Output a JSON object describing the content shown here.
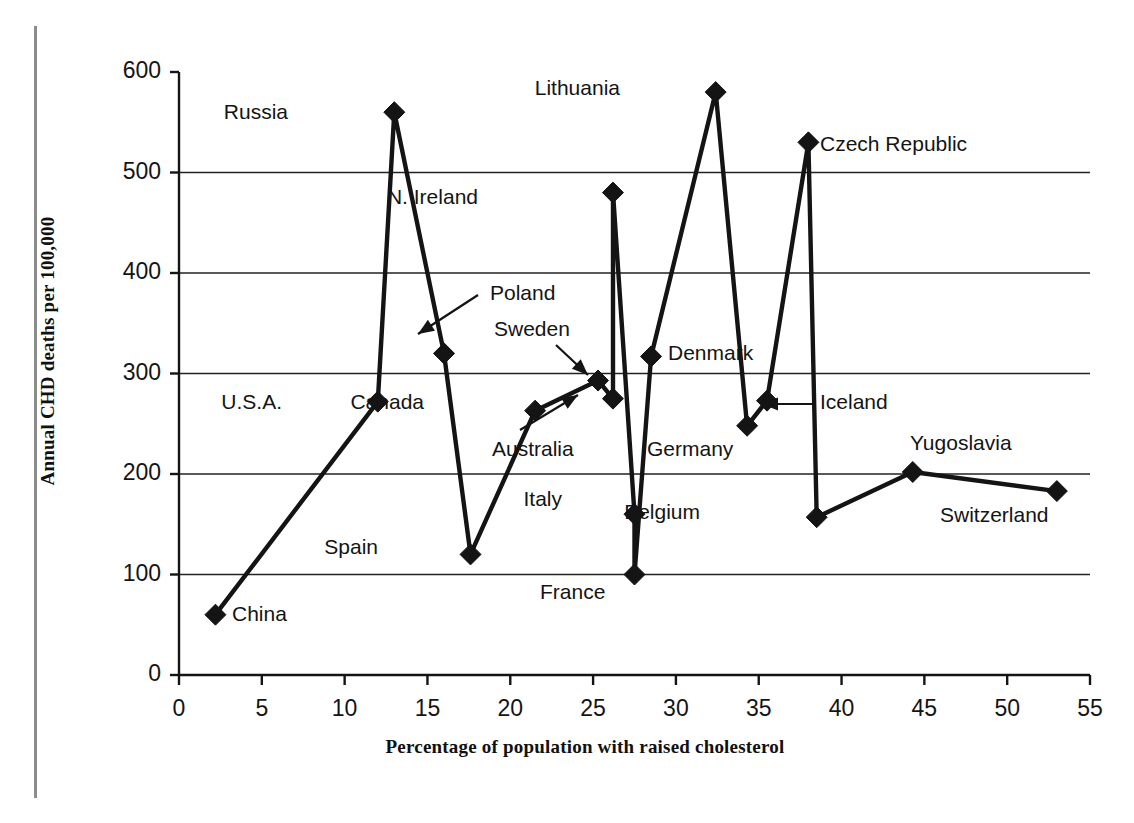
{
  "chart_data": {
    "type": "scatter",
    "title": "",
    "xlabel": "Percentage of population with raised cholesterol",
    "ylabel": "Annual CHD deaths per 100,000",
    "xlim": [
      0,
      55
    ],
    "ylim": [
      0,
      600
    ],
    "xticks": [
      "0",
      "5",
      "10",
      "15",
      "20",
      "25",
      "30",
      "35",
      "40",
      "45",
      "50",
      "55"
    ],
    "yticks": [
      "0",
      "100",
      "200",
      "300",
      "400",
      "500",
      "600"
    ],
    "grid": "horizontal",
    "legend": "none",
    "marker": "filled-diamond",
    "series_name": "Countries",
    "points": [
      {
        "label": "China",
        "x": 2.2,
        "y": 60,
        "lx": 232,
        "ly": 602,
        "anchor": "left"
      },
      {
        "label": "U.S.A.",
        "x": 12.0,
        "y": 272,
        "lx": 282,
        "ly": 390,
        "anchor": "right"
      },
      {
        "label": "Russia",
        "x": 13.0,
        "y": 560,
        "lx": 288,
        "ly": 100,
        "anchor": "right"
      },
      {
        "label": "Poland",
        "x": 16.0,
        "y": 320,
        "lx": 490,
        "ly": 281,
        "anchor": "left"
      },
      {
        "label": "Spain",
        "x": 17.6,
        "y": 120,
        "lx": 378,
        "ly": 535,
        "anchor": "right"
      },
      {
        "label": "Australia",
        "x": 21.5,
        "y": 263,
        "lx": 492,
        "ly": 437,
        "anchor": "left"
      },
      {
        "label": "Canada",
        "x": 21.5,
        "y": 263,
        "lx": 424,
        "ly": 390,
        "anchor": "right"
      },
      {
        "label": "Sweden",
        "x": 25.3,
        "y": 293,
        "lx": 494,
        "ly": 317,
        "anchor": "left"
      },
      {
        "label": "N. Ireland",
        "x": 26.2,
        "y": 480,
        "lx": 478,
        "ly": 185,
        "anchor": "right"
      },
      {
        "label": "Italy",
        "x": 27.5,
        "y": 160,
        "lx": 562,
        "ly": 487,
        "anchor": "right"
      },
      {
        "label": "France",
        "x": 27.5,
        "y": 100,
        "lx": 540,
        "ly": 580,
        "anchor": "left"
      },
      {
        "label": "Germany",
        "x": 28.5,
        "y": 317,
        "lx": 647,
        "ly": 437,
        "anchor": "left"
      },
      {
        "label": "Denmark",
        "x": 28.5,
        "y": 317,
        "lx": 668,
        "ly": 341,
        "anchor": "left"
      },
      {
        "label": "Lithuania",
        "x": 32.4,
        "y": 580,
        "lx": 620,
        "ly": 76,
        "anchor": "right"
      },
      {
        "label": "Iceland",
        "x": 35.5,
        "y": 273,
        "lx": 820,
        "ly": 390,
        "anchor": "left"
      },
      {
        "label": "Czech Republic",
        "x": 38.0,
        "y": 530,
        "lx": 820,
        "ly": 132,
        "anchor": "left"
      },
      {
        "label": "Belgium",
        "x": 38.5,
        "y": 157,
        "lx": 700,
        "ly": 500,
        "anchor": "right"
      },
      {
        "label": "Yugoslavia",
        "x": 44.3,
        "y": 202,
        "lx": 910,
        "ly": 431,
        "anchor": "left"
      },
      {
        "label": "Switzerland",
        "x": 53.0,
        "y": 183,
        "lx": 940,
        "ly": 503,
        "anchor": "left"
      }
    ],
    "connected_path": [
      {
        "x": 2.2,
        "y": 60
      },
      {
        "x": 12.0,
        "y": 272
      },
      {
        "x": 13.0,
        "y": 560
      },
      {
        "x": 16.0,
        "y": 320
      },
      {
        "x": 17.6,
        "y": 120
      },
      {
        "x": 21.5,
        "y": 263
      },
      {
        "x": 25.3,
        "y": 293
      },
      {
        "x": 26.2,
        "y": 275
      },
      {
        "x": 26.2,
        "y": 480
      },
      {
        "x": 27.5,
        "y": 160
      },
      {
        "x": 27.5,
        "y": 100
      },
      {
        "x": 28.5,
        "y": 317
      },
      {
        "x": 32.4,
        "y": 580
      },
      {
        "x": 34.3,
        "y": 248
      },
      {
        "x": 35.5,
        "y": 273
      },
      {
        "x": 38.0,
        "y": 530
      },
      {
        "x": 38.5,
        "y": 157
      },
      {
        "x": 44.3,
        "y": 202
      },
      {
        "x": 53.0,
        "y": 183
      }
    ],
    "callouts": [
      {
        "name": "poland-arrow",
        "from": [
          478,
          295
        ],
        "to": [
          418,
          334
        ]
      },
      {
        "name": "sweden-arrow",
        "from": [
          556,
          345
        ],
        "to": [
          588,
          375
        ]
      },
      {
        "name": "australia-arrow",
        "from": [
          520,
          430
        ],
        "to": [
          578,
          395
        ]
      },
      {
        "name": "iceland-arrow",
        "from": [
          812,
          404
        ],
        "to": [
          762,
          404
        ]
      }
    ],
    "colors": {
      "ink": "#141414",
      "grid": "#222222",
      "background": "#ffffff",
      "page_rule": "#8c8c8c"
    }
  }
}
